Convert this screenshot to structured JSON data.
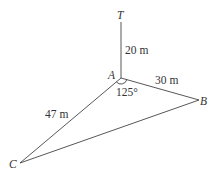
{
  "diagram": {
    "points": {
      "T": {
        "label": "T"
      },
      "A": {
        "label": "A"
      },
      "B": {
        "label": "B"
      },
      "C": {
        "label": "C"
      }
    },
    "segments": {
      "AT": {
        "label": "20 m"
      },
      "AB": {
        "label": "30 m"
      },
      "AC": {
        "label": "47 m"
      }
    },
    "angle_CAB": {
      "label": "125°"
    },
    "line_color": "#444444"
  }
}
